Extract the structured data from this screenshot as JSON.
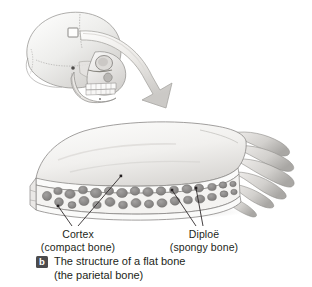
{
  "figure": {
    "domain_note": "anatomy textbook illustration",
    "background_color": "#ffffff",
    "ink_color": "#231f20",
    "bone_fill": "#f2f1ef",
    "bone_shade": "#c9c7c4",
    "trabecula_dark": "#8f8d8b"
  },
  "illustration": {
    "skull": {
      "name": "lateral skull",
      "marker": {
        "name": "parietal sample square",
        "visible": true
      }
    },
    "arrow": {
      "name": "curved magnification arrow",
      "direction": "down-right"
    },
    "bone_block": {
      "name": "flat bone section",
      "layers": [
        "outer cortex",
        "diploe",
        "inner cortex"
      ],
      "edge": "sutural serrations"
    }
  },
  "labels": [
    {
      "id": "cortex",
      "term": "Cortex",
      "sub": "(compact bone)",
      "leaders": 2
    },
    {
      "id": "diploe",
      "term": "Diploë",
      "sub": "(spongy bone)",
      "leaders": 2
    }
  ],
  "caption": {
    "badge": "b",
    "line1": "The structure of a flat bone",
    "line2": "(the parietal bone)"
  }
}
